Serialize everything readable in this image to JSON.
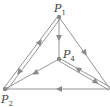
{
  "diagram": {
    "type": "directed-graph",
    "colors": {
      "line": "#8a8a8a",
      "node": "#8a8a8a",
      "label": "#444444"
    },
    "nodes": [
      {
        "id": "P1",
        "label": "P",
        "sub": "1",
        "x": 59,
        "y": 17
      },
      {
        "id": "P2",
        "label": "P",
        "sub": "2",
        "x": 5,
        "y": 89
      },
      {
        "id": "P3",
        "label": "P",
        "sub": "3",
        "x": 110,
        "y": 89
      },
      {
        "id": "P4",
        "label": "P",
        "sub": "4",
        "x": 59,
        "y": 59
      }
    ],
    "edges": [
      {
        "from": "P2",
        "to": "P1"
      },
      {
        "from": "P1",
        "to": "P2"
      },
      {
        "from": "P1",
        "to": "P4"
      },
      {
        "from": "P1",
        "to": "P3"
      },
      {
        "from": "P4",
        "to": "P2"
      },
      {
        "from": "P4",
        "to": "P3"
      },
      {
        "from": "P3",
        "to": "P4"
      },
      {
        "from": "P3",
        "to": "P2"
      }
    ]
  }
}
